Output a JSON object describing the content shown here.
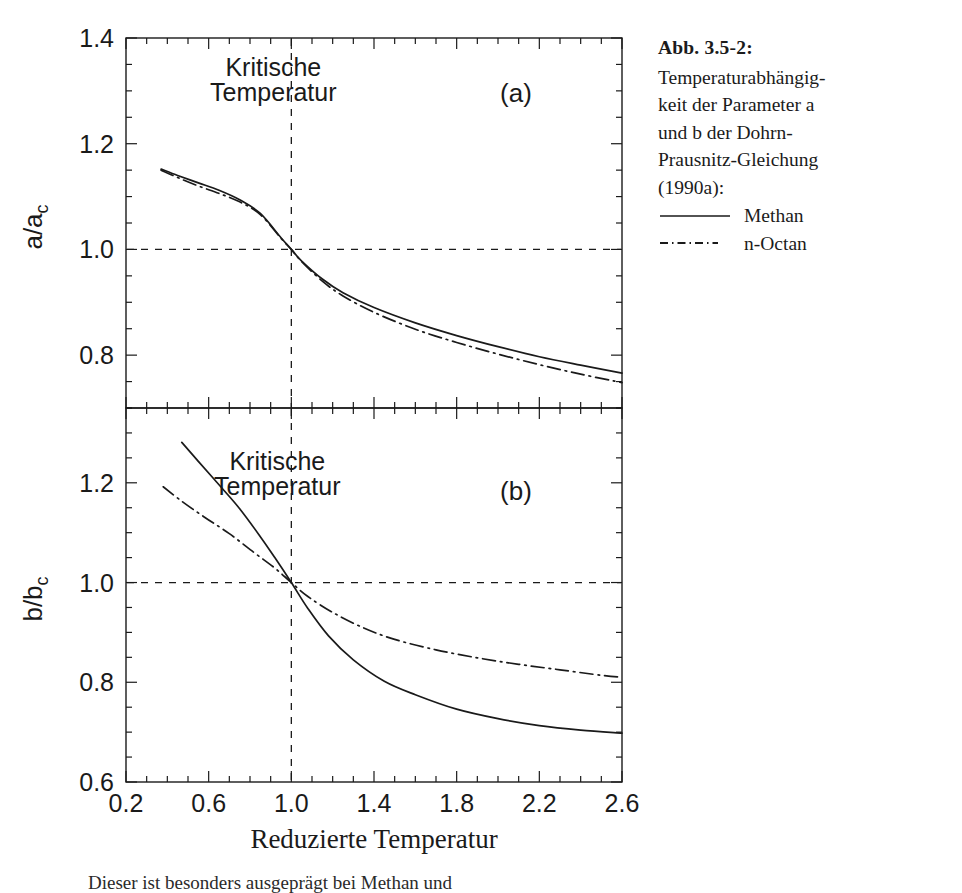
{
  "caption": {
    "title": "Abb. 3.5-2:",
    "lines": [
      "Temperaturabhängig-",
      "keit der Parameter a",
      "und b der Dohrn-",
      "Prausnitz-Gleichung",
      "(1990a):"
    ],
    "legend": [
      {
        "key": "solid-line",
        "label": "Methan"
      },
      {
        "key": "dash-dot-line",
        "label": "n-Octan"
      }
    ]
  },
  "body_text": "Dieser ist besonders ausgeprägt bei Methan und",
  "chart_data": {
    "type": "line",
    "xlabel": "Reduzierte Temperatur",
    "xlim": [
      0.2,
      2.6
    ],
    "xticks": [
      0.2,
      0.6,
      1.0,
      1.4,
      1.8,
      2.2,
      2.6
    ],
    "xtick_labels": [
      "0.2",
      "0.6",
      "1.0",
      "1.4",
      "1.8",
      "2.2",
      "2.6"
    ],
    "xminor_step": 0.1,
    "grid": false,
    "legend_position": "right-caption",
    "legend_entries": [
      "Methan",
      "n-Octan"
    ],
    "panels": [
      {
        "id": "a",
        "panel_label": "(a)",
        "ylabel": "a/a_c",
        "ylabel_display": "a/a",
        "ylabel_sub": "c",
        "ylim": [
          0.7,
          1.4
        ],
        "yticks": [
          0.8,
          1.0,
          1.2,
          1.4
        ],
        "ytick_labels": [
          "0.8",
          "1.0",
          "1.2",
          "1.4"
        ],
        "yminor_step": 0.05,
        "annotation": "Kritische\nTemperatur",
        "annotation_line1": "Kritische",
        "annotation_line2": "Temperatur",
        "reference_lines": [
          {
            "orientation": "vertical",
            "value": 1.0,
            "style": "dashed"
          },
          {
            "orientation": "horizontal",
            "value": 1.0,
            "style": "dashed"
          }
        ],
        "series": [
          {
            "name": "Methan",
            "style": "solid",
            "x": [
              0.37,
              0.45,
              0.55,
              0.65,
              0.75,
              0.85,
              0.95,
              1.0,
              1.05,
              1.15,
              1.25,
              1.4,
              1.6,
              1.8,
              2.0,
              2.2,
              2.4,
              2.6
            ],
            "y": [
              1.152,
              1.14,
              1.126,
              1.112,
              1.094,
              1.068,
              1.022,
              1.0,
              0.978,
              0.944,
              0.918,
              0.89,
              0.861,
              0.837,
              0.816,
              0.797,
              0.781,
              0.766
            ]
          },
          {
            "name": "n-Octan",
            "style": "dash-dot",
            "x": [
              0.37,
              0.45,
              0.55,
              0.65,
              0.75,
              0.85,
              0.95,
              1.0,
              1.05,
              1.15,
              1.25,
              1.4,
              1.6,
              1.8,
              2.0,
              2.2,
              2.4,
              2.6
            ],
            "y": [
              1.15,
              1.136,
              1.12,
              1.106,
              1.09,
              1.066,
              1.021,
              1.0,
              0.977,
              0.94,
              0.912,
              0.881,
              0.849,
              0.824,
              0.802,
              0.782,
              0.764,
              0.748
            ]
          }
        ]
      },
      {
        "id": "b",
        "panel_label": "(b)",
        "ylabel": "b/b_c",
        "ylabel_display": "b/b",
        "ylabel_sub": "c",
        "ylim": [
          0.6,
          1.35
        ],
        "yticks": [
          0.6,
          0.8,
          1.0,
          1.2
        ],
        "ytick_labels": [
          "0.6",
          "0.8",
          "1.0",
          "1.2"
        ],
        "yminor_step": 0.05,
        "annotation": "Kritische\nTemperatur",
        "annotation_line1": "Kritische",
        "annotation_line2": "Temperatur",
        "reference_lines": [
          {
            "orientation": "vertical",
            "value": 1.0,
            "style": "dashed"
          },
          {
            "orientation": "horizontal",
            "value": 1.0,
            "style": "dashed"
          }
        ],
        "series": [
          {
            "name": "Methan",
            "style": "solid",
            "x": [
              0.47,
              0.55,
              0.65,
              0.75,
              0.85,
              0.92,
              1.0,
              1.08,
              1.18,
              1.3,
              1.45,
              1.6,
              1.8,
              2.0,
              2.2,
              2.4,
              2.6
            ],
            "y": [
              1.281,
              1.243,
              1.196,
              1.148,
              1.092,
              1.05,
              1.0,
              0.948,
              0.893,
              0.845,
              0.802,
              0.775,
              0.746,
              0.727,
              0.713,
              0.704,
              0.698
            ]
          },
          {
            "name": "n-Octan",
            "style": "dash-dot",
            "x": [
              0.38,
              0.47,
              0.58,
              0.7,
              0.82,
              0.92,
              1.0,
              1.08,
              1.2,
              1.35,
              1.5,
              1.7,
              1.9,
              2.1,
              2.3,
              2.5,
              2.6
            ],
            "y": [
              1.192,
              1.163,
              1.131,
              1.098,
              1.06,
              1.029,
              1.0,
              0.972,
              0.94,
              0.909,
              0.886,
              0.865,
              0.849,
              0.836,
              0.825,
              0.814,
              0.81
            ]
          }
        ]
      }
    ]
  }
}
